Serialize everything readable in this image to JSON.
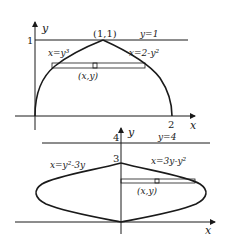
{
  "diagrams": [
    {
      "id": "top",
      "axis_labels": {
        "x": "x",
        "y": "y"
      },
      "ticks": {
        "y_one": "1",
        "x_two": "2"
      },
      "point_label": "(1,1)",
      "line_label": "y=1",
      "left_curve_label": "x=y³",
      "right_curve_label": "x=2-y²",
      "strip_label": "(x,y)"
    },
    {
      "id": "bottom",
      "axis_labels": {
        "x": "x",
        "y": "y"
      },
      "ticks": {
        "y_three": "3",
        "y_four": "4"
      },
      "line_label": "y=4",
      "left_curve_label": "x=y²-3y",
      "right_curve_label": "x=3y-y²",
      "strip_label": "(x,y)"
    }
  ],
  "colors": {
    "stroke": "#1a1a1a",
    "background": "#ffffff"
  }
}
